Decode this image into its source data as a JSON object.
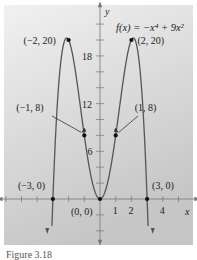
{
  "figure": {
    "caption": "Figure 3.18",
    "panel_color_top": "#efefef",
    "panel_color_bottom": "#c9c9c9",
    "curve_color": "#555555",
    "axis_color": "#777777",
    "point_color": "#111111"
  },
  "chart_data": {
    "type": "line",
    "title": "f(x) = −x⁴ + 9x²",
    "function": "f(x) = -x^4 + 9x^2",
    "xlabel": "x",
    "ylabel": "y",
    "xlim": [
      -6.4,
      6.2
    ],
    "ylim": [
      -5.5,
      24.5
    ],
    "grid": false,
    "x_ticks": [
      -6,
      -5,
      -4,
      -3,
      -2,
      -1,
      0,
      1,
      2,
      3,
      4,
      5
    ],
    "x_tick_labels": [
      {
        "value": 1,
        "label": "1"
      },
      {
        "value": 2,
        "label": "2"
      },
      {
        "value": 4,
        "label": "4"
      }
    ],
    "y_ticks": [
      -4,
      -2,
      2,
      4,
      6,
      8,
      10,
      12,
      14,
      16,
      18,
      20,
      22
    ],
    "y_tick_labels": [
      {
        "value": 6,
        "label": "6"
      },
      {
        "value": 12,
        "label": "12"
      },
      {
        "value": 18,
        "label": "18"
      }
    ],
    "labeled_points": [
      {
        "x": -2,
        "y": 20,
        "label": "(−2, 20)"
      },
      {
        "x": 2,
        "y": 20,
        "label": "(2, 20)"
      },
      {
        "x": -1,
        "y": 8,
        "label": "(−1, 8)"
      },
      {
        "x": 1,
        "y": 8,
        "label": "(1, 8)"
      },
      {
        "x": -3,
        "y": 0,
        "label": "(−3, 0)"
      },
      {
        "x": 0,
        "y": 0,
        "label": "(0, 0)"
      },
      {
        "x": 3,
        "y": 0,
        "label": "(3, 0)"
      }
    ],
    "annotations": [
      "f(x) = −x⁴ + 9x²"
    ]
  }
}
